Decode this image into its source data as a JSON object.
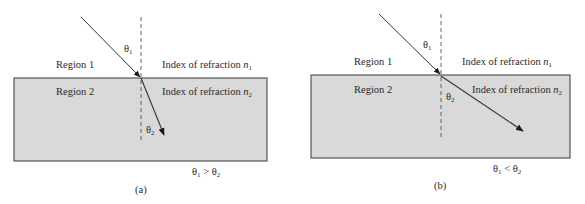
{
  "colors": {
    "background": "#ffffff",
    "region2_fill": "#d9d9d9",
    "border": "#555555",
    "ray": "#333333",
    "normal": "#555555",
    "text": "#2a2a2a"
  },
  "panels": [
    {
      "id": "a",
      "caption": "(a)",
      "region1_label": "Region 1",
      "region2_label": "Region 2",
      "index1_label": "Index of refraction ",
      "index1_symbol": "n",
      "index1_sub": "1",
      "index2_label": "Index of refraction ",
      "index2_symbol": "n",
      "index2_sub": "2",
      "theta1_label": "θ",
      "theta1_sub": "1",
      "theta2_label": "θ",
      "theta2_sub": "2",
      "relation": {
        "left": "θ",
        "left_sub": "1",
        "op": " > ",
        "right": "θ",
        "right_sub": "2"
      }
    },
    {
      "id": "b",
      "caption": "(b)",
      "region1_label": "Region 1",
      "region2_label": "Region 2",
      "index1_label": "Index of refraction ",
      "index1_symbol": "n",
      "index1_sub": "1",
      "index2_label": "Index of refraction ",
      "index2_symbol": "n",
      "index2_sub": "2",
      "theta1_label": "θ",
      "theta1_sub": "1",
      "theta2_label": "θ",
      "theta2_sub": "2",
      "relation": {
        "left": "θ",
        "left_sub": "1",
        "op": " < ",
        "right": "θ",
        "right_sub": "2"
      }
    }
  ]
}
